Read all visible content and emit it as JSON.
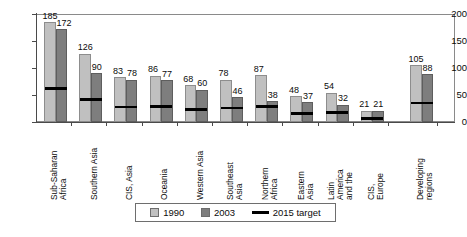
{
  "chart_data": {
    "type": "bar",
    "title": "",
    "subtitle": "",
    "xlabel": "",
    "ylabel": "",
    "ylim": [
      0,
      200
    ],
    "yticks": [
      0,
      50,
      100,
      150,
      200
    ],
    "grid": false,
    "legend_position": "bottom",
    "categories": [
      "Sub-Saharan Africa",
      "Southern Asia",
      "CIS, Asia",
      "Oceania",
      "Western Asia",
      "Southeast Asia",
      "Northern Africa",
      "Eastern Asia",
      "Latin America and the",
      "CIS, Europe",
      "Developing regions"
    ],
    "category_lines": [
      [
        "Sub-Saharan",
        "Africa"
      ],
      [
        "Southern Asia"
      ],
      [
        "CIS, Asia"
      ],
      [
        "Oceania"
      ],
      [
        "Western Asia"
      ],
      [
        "Southeast",
        "Asia"
      ],
      [
        "Northern",
        "Africa"
      ],
      [
        "Eastern",
        "Asia"
      ],
      [
        "Latin",
        "America",
        "and the"
      ],
      [
        "CIS,",
        "Europe"
      ],
      [
        "Developing",
        "regions"
      ]
    ],
    "series": [
      {
        "name": "1990",
        "color": "#c0c0c0",
        "values": [
          185,
          126,
          83,
          86,
          68,
          78,
          87,
          48,
          54,
          21,
          105
        ]
      },
      {
        "name": "2003",
        "color": "#7e7e7e",
        "values": [
          172,
          90,
          78,
          77,
          60,
          46,
          38,
          37,
          32,
          21,
          88
        ]
      },
      {
        "name": "2015 target",
        "color": "#000000",
        "type": "marker-line",
        "values": [
          62,
          42,
          28,
          29,
          23,
          26,
          29,
          16,
          18,
          7,
          35
        ]
      }
    ]
  },
  "legend": {
    "items": [
      {
        "label": "1990",
        "swatch": "light-gray-square"
      },
      {
        "label": "2003",
        "swatch": "dark-gray-square"
      },
      {
        "label": "2015 target",
        "swatch": "black-line"
      }
    ]
  },
  "yaxis": {
    "ticks": [
      "0",
      "50",
      "100",
      "150",
      "200"
    ]
  }
}
